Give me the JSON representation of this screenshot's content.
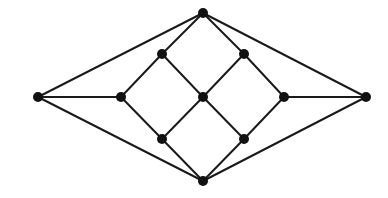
{
  "diagram": {
    "type": "graph",
    "width": 388,
    "height": 198,
    "style": {
      "edge_color": "#1a1a1a",
      "node_color": "#111111",
      "background": "#ffffff",
      "node_radius": 5,
      "edge_width": 2
    },
    "nodes": [
      {
        "id": "top",
        "x": 203,
        "y": 13
      },
      {
        "id": "left",
        "x": 38,
        "y": 97
      },
      {
        "id": "right",
        "x": 366,
        "y": 97
      },
      {
        "id": "bottom",
        "x": 203,
        "y": 181
      },
      {
        "id": "left-inner",
        "x": 121,
        "y": 97
      },
      {
        "id": "right-inner",
        "x": 284,
        "y": 97
      },
      {
        "id": "center",
        "x": 203,
        "y": 97
      },
      {
        "id": "upper-left",
        "x": 162,
        "y": 54
      },
      {
        "id": "upper-right",
        "x": 244,
        "y": 54
      },
      {
        "id": "lower-left",
        "x": 162,
        "y": 139
      },
      {
        "id": "lower-right",
        "x": 244,
        "y": 139
      }
    ],
    "edges": [
      [
        "top",
        "left"
      ],
      [
        "top",
        "upper-left"
      ],
      [
        "top",
        "upper-right"
      ],
      [
        "top",
        "right"
      ],
      [
        "left",
        "left-inner"
      ],
      [
        "left",
        "bottom"
      ],
      [
        "left-inner",
        "upper-left"
      ],
      [
        "left-inner",
        "lower-left"
      ],
      [
        "upper-left",
        "center"
      ],
      [
        "upper-right",
        "center"
      ],
      [
        "upper-right",
        "right-inner"
      ],
      [
        "right-inner",
        "right"
      ],
      [
        "right-inner",
        "lower-right"
      ],
      [
        "center",
        "lower-left"
      ],
      [
        "center",
        "lower-right"
      ],
      [
        "lower-left",
        "bottom"
      ],
      [
        "lower-right",
        "bottom"
      ],
      [
        "right",
        "bottom"
      ]
    ]
  }
}
